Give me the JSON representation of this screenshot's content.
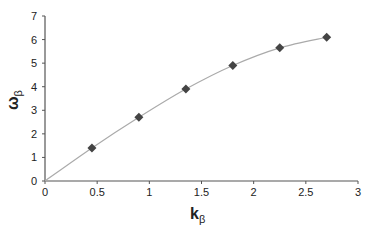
{
  "chart_data": {
    "type": "scatter",
    "title": "",
    "xlabel": "k",
    "xlabel_sub": "β",
    "ylabel": "ω",
    "ylabel_sub": "β",
    "xlim": [
      0,
      3
    ],
    "ylim": [
      0,
      7
    ],
    "xticks": [
      "0",
      "0.5",
      "1",
      "1.5",
      "2",
      "2.5",
      "3"
    ],
    "yticks": [
      "0",
      "1",
      "2",
      "3",
      "4",
      "5",
      "6",
      "7"
    ],
    "grid": false,
    "legend": null,
    "series": [
      {
        "name": "data",
        "marker": "diamond",
        "color": "#444444",
        "x": [
          0.45,
          0.9,
          1.35,
          1.8,
          2.25,
          2.7
        ],
        "y": [
          1.4,
          2.7,
          3.9,
          4.9,
          5.65,
          6.1
        ]
      },
      {
        "name": "fit",
        "line": true,
        "color": "#aaaaaa",
        "x": [
          0,
          0.45,
          0.9,
          1.35,
          1.8,
          2.25,
          2.7
        ],
        "y": [
          0,
          1.4,
          2.7,
          3.9,
          4.9,
          5.65,
          6.1
        ]
      }
    ]
  }
}
